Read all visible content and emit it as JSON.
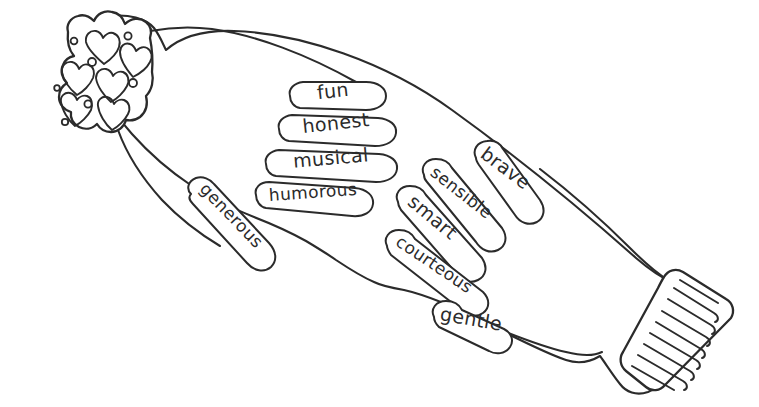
{
  "page": {
    "background_color": "#ffffff",
    "ink_color": "#2b2b2b",
    "width": 759,
    "height": 407
  },
  "left_mitten": {
    "name": "left-mitten",
    "cuff_pattern": "hearts-and-dots",
    "thumb": {
      "label": "generous"
    },
    "fingers": [
      {
        "label": "fun"
      },
      {
        "label": "honest"
      },
      {
        "label": "musical"
      },
      {
        "label": "humorous"
      }
    ]
  },
  "right_mitten": {
    "name": "right-mitten",
    "cuff_pattern": "ribbed-stripes",
    "rib_count": 10,
    "thumb": {
      "label": "gentle"
    },
    "fingers": [
      {
        "label": "brave"
      },
      {
        "label": "sensible"
      },
      {
        "label": "smart"
      },
      {
        "label": "courteous"
      }
    ]
  },
  "words": {
    "fun": "fun",
    "honest": "honest",
    "musical": "musical",
    "humorous": "humorous",
    "generous": "generous",
    "brave": "brave",
    "sensible": "sensible",
    "smart": "smart",
    "courteous": "courteous",
    "gentle": "gentle"
  }
}
